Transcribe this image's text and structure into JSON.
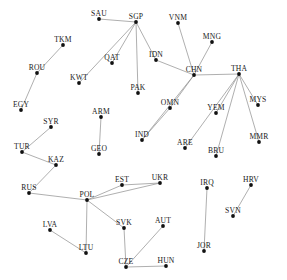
{
  "figure": {
    "type": "network-graph",
    "title": "",
    "caption": "",
    "background_color": "#ffffff",
    "node_color": "#111111",
    "edge_color": "#8c8c8c",
    "label_color": "#1a1a1a",
    "node_count": 42,
    "edge_count": 40
  },
  "graph_data": {
    "type": "network",
    "directed": false,
    "nodes": [
      {
        "id": "SAU",
        "label": "SAU",
        "x": 99,
        "y": 19,
        "lx": 99,
        "ly": 16
      },
      {
        "id": "SGP",
        "label": "SGP",
        "x": 136,
        "y": 22,
        "lx": 136,
        "ly": 19
      },
      {
        "id": "VNM",
        "label": "VNM",
        "x": 178,
        "y": 23,
        "lx": 178,
        "ly": 20
      },
      {
        "id": "MNG",
        "label": "MNG",
        "x": 212,
        "y": 42,
        "lx": 212,
        "ly": 39
      },
      {
        "id": "TKM",
        "label": "TKM",
        "x": 63,
        "y": 45,
        "lx": 63,
        "ly": 42
      },
      {
        "id": "QAT",
        "label": "QAT",
        "x": 112,
        "y": 63,
        "lx": 112,
        "ly": 60
      },
      {
        "id": "IDN",
        "label": "IDN",
        "x": 156,
        "y": 60,
        "lx": 156,
        "ly": 57
      },
      {
        "id": "CHN",
        "label": "CHN",
        "x": 194,
        "y": 75,
        "lx": 194,
        "ly": 72
      },
      {
        "id": "THA",
        "label": "THA",
        "x": 239,
        "y": 74,
        "lx": 239,
        "ly": 71
      },
      {
        "id": "ROU",
        "label": "ROU",
        "x": 37,
        "y": 73,
        "lx": 37,
        "ly": 70
      },
      {
        "id": "KWT",
        "label": "KWT",
        "x": 79,
        "y": 83,
        "lx": 79,
        "ly": 80
      },
      {
        "id": "PAK",
        "label": "PAK",
        "x": 138,
        "y": 93,
        "lx": 138,
        "ly": 90
      },
      {
        "id": "MYS",
        "label": "MYS",
        "x": 258,
        "y": 105,
        "lx": 258,
        "ly": 102
      },
      {
        "id": "EGY",
        "label": "EGY",
        "x": 21,
        "y": 110,
        "lx": 21,
        "ly": 107
      },
      {
        "id": "ARM",
        "label": "ARM",
        "x": 101,
        "y": 117,
        "lx": 101,
        "ly": 114
      },
      {
        "id": "OMN",
        "label": "OMN",
        "x": 170,
        "y": 108,
        "lx": 170,
        "ly": 105
      },
      {
        "id": "YEM",
        "label": "YEM",
        "x": 216,
        "y": 113,
        "lx": 216,
        "ly": 110
      },
      {
        "id": "SYR",
        "label": "SYR",
        "x": 51,
        "y": 127,
        "lx": 51,
        "ly": 124
      },
      {
        "id": "MMR",
        "label": "MMR",
        "x": 259,
        "y": 142,
        "lx": 259,
        "ly": 139
      },
      {
        "id": "TUR",
        "label": "TUR",
        "x": 22,
        "y": 152,
        "lx": 22,
        "ly": 149
      },
      {
        "id": "GEO",
        "label": "GEO",
        "x": 99,
        "y": 154,
        "lx": 99,
        "ly": 151
      },
      {
        "id": "IND",
        "label": "IND",
        "x": 142,
        "y": 140,
        "lx": 142,
        "ly": 137
      },
      {
        "id": "ARE",
        "label": "ARE",
        "x": 185,
        "y": 148,
        "lx": 185,
        "ly": 145
      },
      {
        "id": "BRU",
        "label": "BRU",
        "x": 216,
        "y": 156,
        "lx": 216,
        "ly": 153
      },
      {
        "id": "KAZ",
        "label": "KAZ",
        "x": 56,
        "y": 165,
        "lx": 56,
        "ly": 162
      },
      {
        "id": "RUS",
        "label": "RUS",
        "x": 29,
        "y": 193,
        "lx": 29,
        "ly": 190
      },
      {
        "id": "EST",
        "label": "EST",
        "x": 122,
        "y": 185,
        "lx": 122,
        "ly": 182
      },
      {
        "id": "UKR",
        "label": "UKR",
        "x": 160,
        "y": 183,
        "lx": 160,
        "ly": 180
      },
      {
        "id": "IRQ",
        "label": "IRQ",
        "x": 207,
        "y": 188,
        "lx": 207,
        "ly": 185
      },
      {
        "id": "HRV",
        "label": "HRV",
        "x": 251,
        "y": 185,
        "lx": 251,
        "ly": 182
      },
      {
        "id": "POL",
        "label": "POL",
        "x": 87,
        "y": 200,
        "lx": 87,
        "ly": 197
      },
      {
        "id": "SVN",
        "label": "SVN",
        "x": 233,
        "y": 216,
        "lx": 233,
        "ly": 213
      },
      {
        "id": "LVA",
        "label": "LVA",
        "x": 50,
        "y": 230,
        "lx": 50,
        "ly": 227
      },
      {
        "id": "SVK",
        "label": "SVK",
        "x": 124,
        "y": 228,
        "lx": 124,
        "ly": 225
      },
      {
        "id": "AUT",
        "label": "AUT",
        "x": 163,
        "y": 226,
        "lx": 163,
        "ly": 223
      },
      {
        "id": "LTU",
        "label": "LTU",
        "x": 86,
        "y": 253,
        "lx": 86,
        "ly": 250
      },
      {
        "id": "JOR",
        "label": "JOR",
        "x": 204,
        "y": 251,
        "lx": 204,
        "ly": 248
      },
      {
        "id": "CZE",
        "label": "CZE",
        "x": 126,
        "y": 267,
        "lx": 126,
        "ly": 264
      },
      {
        "id": "HUN",
        "label": "HUN",
        "x": 166,
        "y": 266,
        "lx": 166,
        "ly": 263
      }
    ],
    "edges": [
      [
        "SAU",
        "SGP"
      ],
      [
        "SGP",
        "QAT"
      ],
      [
        "SGP",
        "KWT"
      ],
      [
        "SGP",
        "PAK"
      ],
      [
        "SGP",
        "IDN"
      ],
      [
        "IDN",
        "CHN"
      ],
      [
        "VNM",
        "CHN"
      ],
      [
        "MNG",
        "CHN"
      ],
      [
        "CHN",
        "THA"
      ],
      [
        "CHN",
        "OMN"
      ],
      [
        "CHN",
        "IND"
      ],
      [
        "OMN",
        "IND"
      ],
      [
        "THA",
        "YEM"
      ],
      [
        "THA",
        "ARE"
      ],
      [
        "THA",
        "BRU"
      ],
      [
        "THA",
        "MYS"
      ],
      [
        "THA",
        "MMR"
      ],
      [
        "TKM",
        "ROU"
      ],
      [
        "ROU",
        "EGY"
      ],
      [
        "SYR",
        "TUR"
      ],
      [
        "TUR",
        "KAZ"
      ],
      [
        "KAZ",
        "RUS"
      ],
      [
        "ARM",
        "GEO"
      ],
      [
        "RUS",
        "POL"
      ],
      [
        "POL",
        "EST"
      ],
      [
        "POL",
        "UKR"
      ],
      [
        "EST",
        "UKR"
      ],
      [
        "POL",
        "LTU"
      ],
      [
        "POL",
        "SVK"
      ],
      [
        "LVA",
        "LTU"
      ],
      [
        "SVK",
        "CZE"
      ],
      [
        "CZE",
        "AUT"
      ],
      [
        "CZE",
        "HUN"
      ],
      [
        "IRQ",
        "JOR"
      ],
      [
        "HRV",
        "SVN"
      ]
    ]
  }
}
